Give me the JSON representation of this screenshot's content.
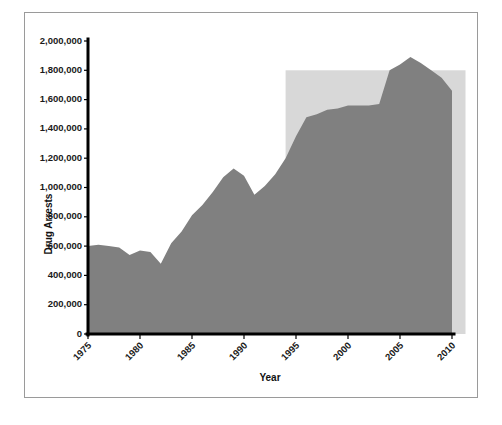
{
  "chart_data": {
    "type": "area",
    "title": "",
    "xlabel": "Year",
    "ylabel": "Drug Arrests",
    "xlim": [
      1975,
      2010
    ],
    "ylim": [
      0,
      2000000
    ],
    "grid": false,
    "legend": "none",
    "x_tick_labels": [
      "1975",
      "1980",
      "1985",
      "1990",
      "1995",
      "2000",
      "2005",
      "2010"
    ],
    "x_ticks": [
      1975,
      1980,
      1985,
      1990,
      1995,
      2000,
      2005,
      2010
    ],
    "y_tick_labels": [
      "0",
      "200,000",
      "400,000",
      "600,000",
      "800,000",
      "1,000,000",
      "1,200,000",
      "1,400,000",
      "1,600,000",
      "1,800,000",
      "2,000,000"
    ],
    "y_ticks": [
      0,
      200000,
      400000,
      600000,
      800000,
      1000000,
      1200000,
      1400000,
      1600000,
      1800000,
      2000000
    ],
    "x": [
      1975,
      1976,
      1977,
      1978,
      1979,
      1980,
      1981,
      1982,
      1983,
      1984,
      1985,
      1986,
      1987,
      1988,
      1989,
      1990,
      1991,
      1992,
      1993,
      1994,
      1995,
      1996,
      1997,
      1998,
      1999,
      2000,
      2001,
      2002,
      2003,
      2004,
      2005,
      2006,
      2007,
      2008,
      2009,
      2010
    ],
    "values": [
      600000,
      610000,
      600000,
      590000,
      540000,
      570000,
      560000,
      480000,
      620000,
      700000,
      810000,
      880000,
      970000,
      1070000,
      1130000,
      1080000,
      950000,
      1010000,
      1090000,
      1200000,
      1350000,
      1480000,
      1500000,
      1530000,
      1540000,
      1560000,
      1560000,
      1560000,
      1570000,
      1800000,
      1840000,
      1890000,
      1850000,
      1800000,
      1750000,
      1660000
    ],
    "series_name": "Drug Arrests",
    "area_color": "#808080",
    "highlight_band": {
      "label": "",
      "x_start": 1994,
      "x_end": 2011.3,
      "y_top": 1800000,
      "color": "#d8d8d8"
    },
    "axis_color": "#000000",
    "frame_color": "#9a9a9a"
  }
}
